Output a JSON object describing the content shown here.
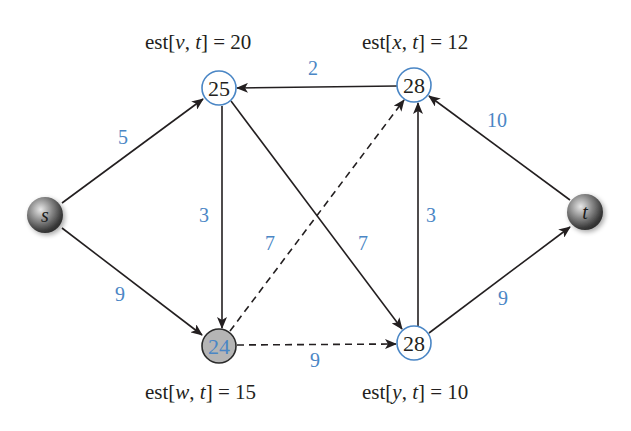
{
  "diagram": {
    "colors": {
      "edge": "#231f20",
      "weight": "#4a86c5",
      "node_ring": "#4a86c5",
      "active_node_fill": "#b5b5b5",
      "terminal_node": "#7a7a7a"
    },
    "nodes": [
      {
        "id": "s",
        "label": "s",
        "type": "terminal",
        "x": 45,
        "y": 215
      },
      {
        "id": "t",
        "label": "t",
        "type": "terminal",
        "x": 585,
        "y": 212
      },
      {
        "id": "v",
        "value": "25",
        "type": "estimate",
        "x": 219,
        "y": 88,
        "est": {
          "var": "v",
          "text": "est[v, t] = 20",
          "value": "20"
        }
      },
      {
        "id": "x",
        "value": "28",
        "type": "estimate",
        "x": 414,
        "y": 85,
        "est": {
          "var": "x",
          "text": "est[x, t] = 12",
          "value": "12"
        }
      },
      {
        "id": "w",
        "value": "24",
        "type": "active",
        "x": 219,
        "y": 346,
        "est": {
          "var": "w",
          "text": "est[w, t] = 15",
          "value": "15"
        }
      },
      {
        "id": "y",
        "value": "28",
        "type": "estimate",
        "x": 414,
        "y": 343,
        "est": {
          "var": "y",
          "text": "est[y, t] = 10",
          "value": "10"
        }
      }
    ],
    "edges": [
      {
        "from": "s",
        "to": "v",
        "weight": "5",
        "style": "solid"
      },
      {
        "from": "s",
        "to": "w",
        "weight": "9",
        "style": "solid"
      },
      {
        "from": "x",
        "to": "v",
        "weight": "2",
        "style": "solid"
      },
      {
        "from": "v",
        "to": "w",
        "weight": "3",
        "style": "solid"
      },
      {
        "from": "v",
        "to": "y",
        "weight": "7",
        "style": "solid"
      },
      {
        "from": "w",
        "to": "x",
        "weight": "7",
        "style": "dashed"
      },
      {
        "from": "w",
        "to": "y",
        "weight": "9",
        "style": "dashed"
      },
      {
        "from": "y",
        "to": "x",
        "weight": "3",
        "style": "solid"
      },
      {
        "from": "t",
        "to": "x",
        "weight": "10",
        "style": "solid"
      },
      {
        "from": "y",
        "to": "t",
        "weight": "9",
        "style": "solid"
      }
    ],
    "labels": {
      "s": "s",
      "t": "t",
      "v_value": "25",
      "x_value": "28",
      "w_value": "24",
      "y_value": "28",
      "est_v_prefix": "est[",
      "est_v_var": "v",
      "est_v_suffix": "] = 20",
      "est_x_var": "x",
      "est_x_suffix": "] = 12",
      "est_w_var": "w",
      "est_w_suffix": "] = 15",
      "est_y_var": "y",
      "est_y_suffix": "] = 10",
      "est_t_var": "t",
      "comma": ", "
    },
    "weights": {
      "s_v": "5",
      "s_w": "9",
      "x_v": "2",
      "v_w": "3",
      "v_y": "7",
      "w_x": "7",
      "w_y": "9",
      "y_x": "3",
      "t_x": "10",
      "y_t": "9"
    }
  }
}
